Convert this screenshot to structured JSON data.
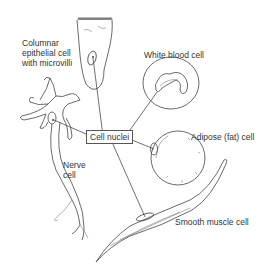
{
  "diagram": {
    "labels": {
      "columnar": "Columnar\nepithelial cell\nwith microvilli",
      "wbc": "White blood cell",
      "adipose": "Adipose (fat) cell",
      "nerve": "Nerve\ncell",
      "smooth": "Smooth muscle cell",
      "nuclei": "Cell nuclei"
    },
    "cells": [
      {
        "name": "Columnar epithelial cell with microvilli"
      },
      {
        "name": "White blood cell"
      },
      {
        "name": "Adipose (fat) cell"
      },
      {
        "name": "Nerve cell"
      },
      {
        "name": "Smooth muscle cell"
      }
    ],
    "colors": {
      "line": "#444444",
      "text": "#333333",
      "background": "#ffffff"
    }
  }
}
